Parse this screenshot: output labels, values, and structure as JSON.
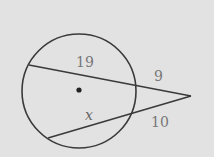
{
  "diagram": {
    "type": "circle-two-secants",
    "colors": {
      "background": "#e2e2e2",
      "stroke": "#3a3a3a",
      "label": "#777777"
    },
    "labels": {
      "upper_chord": "19",
      "upper_external": "9",
      "lower_chord": "x",
      "lower_external": "10"
    }
  }
}
